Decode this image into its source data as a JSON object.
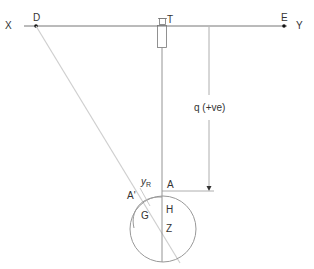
{
  "diagram": {
    "labels": {
      "x": "X",
      "y": "Y",
      "d": "D",
      "e": "E",
      "t": "T",
      "q": "q (+ve)",
      "a": "A",
      "a_prime": "A'",
      "yr_main": "y",
      "yr_sub": "R",
      "g": "G",
      "h": "H",
      "z": "Z"
    },
    "colors": {
      "line": "#777777",
      "light_line": "#cccccc",
      "circle": "#999999",
      "text": "#333333"
    }
  }
}
